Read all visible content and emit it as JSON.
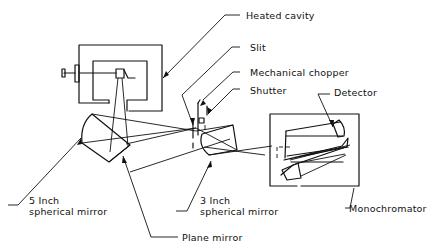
{
  "diagram": {
    "type": "optical-setup",
    "labels": {
      "heated_cavity": "Heated cavity",
      "slit": "Slit",
      "mechanical_chopper": "Mechanical chopper",
      "shutter": "Shutter",
      "detector": "Detector",
      "five_inch_mirror_line1": "5 Inch",
      "five_inch_mirror_line2": "spherical mirror",
      "three_inch_mirror_line1": "3 Inch",
      "three_inch_mirror_line2": "spherical mirror",
      "monochromator": "Monochromator",
      "plane_mirror": "Plane mirror"
    },
    "components": [
      {
        "id": "heated-cavity",
        "label": "Heated cavity"
      },
      {
        "id": "slit",
        "label": "Slit"
      },
      {
        "id": "mechanical-chopper",
        "label": "Mechanical chopper"
      },
      {
        "id": "shutter",
        "label": "Shutter"
      },
      {
        "id": "five-inch-spherical-mirror",
        "label": "5 Inch spherical mirror"
      },
      {
        "id": "plane-mirror",
        "label": "Plane mirror"
      },
      {
        "id": "three-inch-spherical-mirror",
        "label": "3 Inch spherical mirror"
      },
      {
        "id": "monochromator",
        "label": "Monochromator"
      },
      {
        "id": "detector",
        "label": "Detector"
      }
    ],
    "colors": {
      "line": "#111111",
      "background": "#ffffff"
    }
  }
}
